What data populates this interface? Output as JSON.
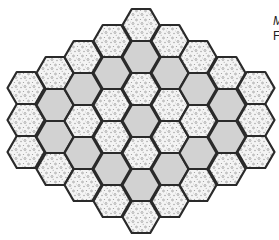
{
  "diagram": {
    "type": "hexagonal-tile-grid",
    "orientation": "flat-top",
    "hex": {
      "width": 37,
      "height": 32,
      "column_spacing": 28.75,
      "origin_x": 26,
      "stroke": "#2a2a2a",
      "stroke_width": 2.2
    },
    "colors": {
      "plain": "#d2d2d2",
      "textured_bg": "#f4f4f4",
      "texture_dot": "#8a8a8a"
    },
    "legend": {
      "plain": "gray",
      "textured": "speckled"
    },
    "columns": [
      {
        "x": 26,
        "rows": [
          88,
          120,
          152
        ],
        "pattern": [
          "T",
          "T",
          "T"
        ]
      },
      {
        "x": 55,
        "rows": [
          73,
          105,
          137,
          169
        ],
        "pattern": [
          "T",
          "G",
          "G",
          "T"
        ]
      },
      {
        "x": 83,
        "rows": [
          57,
          89,
          121,
          153,
          185
        ],
        "pattern": [
          "T",
          "G",
          "T",
          "G",
          "T"
        ]
      },
      {
        "x": 112,
        "rows": [
          41,
          73,
          105,
          137,
          169,
          201
        ],
        "pattern": [
          "T",
          "G",
          "T",
          "T",
          "G",
          "T"
        ]
      },
      {
        "x": 141,
        "rows": [
          25,
          57,
          89,
          121,
          153,
          185,
          217
        ],
        "pattern": [
          "T",
          "G",
          "T",
          "G",
          "T",
          "G",
          "T"
        ]
      },
      {
        "x": 170,
        "rows": [
          41,
          73,
          105,
          137,
          169,
          201
        ],
        "pattern": [
          "T",
          "G",
          "T",
          "T",
          "G",
          "T"
        ]
      },
      {
        "x": 198,
        "rows": [
          57,
          89,
          121,
          153,
          185
        ],
        "pattern": [
          "T",
          "G",
          "T",
          "G",
          "T"
        ]
      },
      {
        "x": 227,
        "rows": [
          73,
          105,
          137,
          169
        ],
        "pattern": [
          "T",
          "G",
          "G",
          "T"
        ]
      },
      {
        "x": 256,
        "rows": [
          88,
          120,
          152
        ],
        "pattern": [
          "T",
          "T",
          "T"
        ]
      }
    ],
    "total_tiles": 43
  },
  "caption_fragments": {
    "line1": "M",
    "line2": "F"
  }
}
